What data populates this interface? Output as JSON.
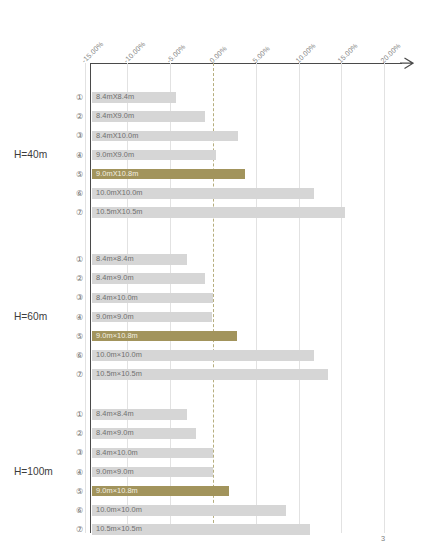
{
  "page": {
    "number": "3"
  },
  "chart_data": {
    "type": "bar",
    "title": "",
    "xlabel": "",
    "ylabel": "",
    "orientation": "horizontal",
    "xlim": [
      -15.0,
      20.0
    ],
    "grid": true,
    "legend": "none",
    "zero_reference_line": 0.0,
    "unit": "%",
    "axis": {
      "ticks": [
        -15.0,
        -10.0,
        -5.0,
        0.0,
        5.0,
        10.0,
        15.0,
        20.0
      ],
      "tick_labels": [
        "-15.00%",
        "-10.00%",
        "-5.00%",
        "0.00%",
        "5.00%",
        "10.00%",
        "15.00%",
        "20.00%"
      ]
    },
    "colors": {
      "bar": "#d6d6d6",
      "highlight": "#a2945c",
      "zero_line": "#b6ae7e",
      "grid": "#e2e2e2",
      "axis": "#4a4a4a"
    },
    "groups": [
      {
        "name": "H=40m",
        "label": "H=40m",
        "categories": [
          {
            "index": "①",
            "label": "8.4mX8.4m",
            "value": -4.3,
            "highlight": false
          },
          {
            "index": "②",
            "label": "8.4mX9.0m",
            "value": -0.9,
            "highlight": false
          },
          {
            "index": "③",
            "label": "8.4mX10.0m",
            "value": 2.9,
            "highlight": false
          },
          {
            "index": "④",
            "label": "9.0mX9.0m",
            "value": 0.4,
            "highlight": false
          },
          {
            "index": "⑤",
            "label": "9.0mX10.8m",
            "value": 3.7,
            "highlight": true
          },
          {
            "index": "⑥",
            "label": "10.0mX10.0m",
            "value": 11.8,
            "highlight": false
          },
          {
            "index": "⑦",
            "label": "10.5mX10.5m",
            "value": 15.4,
            "highlight": false
          }
        ]
      },
      {
        "name": "H=60m",
        "label": "H=60m",
        "categories": [
          {
            "index": "①",
            "label": "8.4m×8.4m",
            "value": -3.0,
            "highlight": false
          },
          {
            "index": "②",
            "label": "8.4m×9.0m",
            "value": -0.9,
            "highlight": false
          },
          {
            "index": "③",
            "label": "8.4m×10.0m",
            "value": 0.0,
            "highlight": false
          },
          {
            "index": "④",
            "label": "9.0m×9.0m",
            "value": -0.1,
            "highlight": false
          },
          {
            "index": "⑤",
            "label": "9.0m×10.8m",
            "value": 2.8,
            "highlight": true
          },
          {
            "index": "⑥",
            "label": "10.0m×10.0m",
            "value": 11.8,
            "highlight": false
          },
          {
            "index": "⑦",
            "label": "10.5m×10.5m",
            "value": 13.4,
            "highlight": false
          }
        ]
      },
      {
        "name": "H=100m",
        "label": "H=100m",
        "categories": [
          {
            "index": "①",
            "label": "8.4m×8.4m",
            "value": -3.0,
            "highlight": false
          },
          {
            "index": "②",
            "label": "8.4m×9.0m",
            "value": -2.0,
            "highlight": false
          },
          {
            "index": "③",
            "label": "8.4m×10.0m",
            "value": 0.0,
            "highlight": false
          },
          {
            "index": "④",
            "label": "9.0m×9.0m",
            "value": 0.0,
            "highlight": false
          },
          {
            "index": "⑤",
            "label": "9.0m×10.8m",
            "value": 1.9,
            "highlight": true
          },
          {
            "index": "⑥",
            "label": "10.0m×10.0m",
            "value": 8.5,
            "highlight": false
          },
          {
            "index": "⑦",
            "label": "10.5m×10.5m",
            "value": 11.3,
            "highlight": false
          }
        ]
      }
    ]
  }
}
